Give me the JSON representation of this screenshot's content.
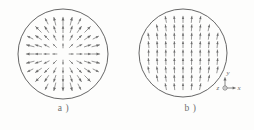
{
  "figure": {
    "background_color": "#fdfdfc",
    "ink_color": "#6b6b6b",
    "outline_color": "#555555",
    "panels": [
      {
        "id": "a",
        "caption": "a )",
        "field_type": "radial-source",
        "description": "Circle containing a radially outward vector field (source); arrows emanate from the center in all directions and grow longer toward the boundary.",
        "circle": {
          "cx": 63,
          "cy": 54,
          "r": 45
        }
      },
      {
        "id": "b",
        "caption": "b )",
        "field_type": "uniform-vertical",
        "description": "Circle containing a predominantly upward (+y) vector field arranged in vertical columns, fanning slightly outward near the left and right edges.",
        "circle": {
          "cx": 56,
          "cy": 53,
          "r": 44
        }
      }
    ],
    "axis_triad": {
      "x_label": "x",
      "y_label": "y",
      "z_label": "z",
      "z_symbol": "out-of-page",
      "origin": {
        "x": 98,
        "y": 88
      }
    }
  },
  "chart_data": {
    "type": "scatter",
    "title": "",
    "xlabel": "",
    "ylabel": "",
    "subplots": [
      {
        "label": "a )",
        "type": "quiver",
        "field": "radial",
        "domain": "unit disk",
        "formula": "V = (x, y)",
        "note": "arrow length proportional to radius"
      },
      {
        "label": "b )",
        "type": "quiver",
        "field": "uniform-vertical",
        "domain": "unit disk",
        "formula": "V = (0, 1)",
        "note": "slight outward fan near horizontal extremes"
      }
    ],
    "legend": [],
    "grid": false
  }
}
